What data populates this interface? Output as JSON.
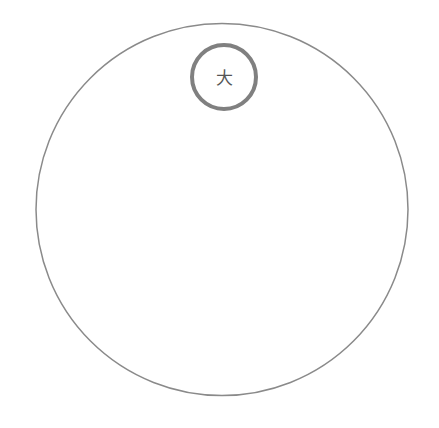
{
  "canvas": {
    "width": 439,
    "height": 428,
    "background_color": "#ffffff"
  },
  "diagram": {
    "title": "",
    "type": "nested-circles",
    "outer_circle": {
      "name": "large-circle",
      "cx": 222,
      "cy": 209.5,
      "r": 186,
      "stroke_color": "#8a8a8a",
      "stroke_width": 1.5,
      "fill": "none"
    },
    "inner_circle": {
      "name": "small-circle",
      "cx": 224,
      "cy": 77,
      "r": 32,
      "stroke_color": "#808080",
      "stroke_width": 4,
      "fill": "#ffffff",
      "label": "大",
      "label_color": "#555555",
      "label_font_size": 17,
      "label_cx": 224,
      "label_cy": 78
    }
  }
}
